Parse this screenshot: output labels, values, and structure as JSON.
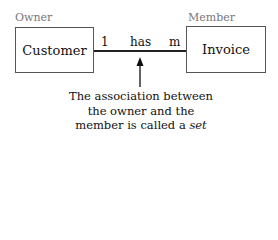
{
  "owner": {
    "role_label": "Owner",
    "entity": "Customer",
    "cardinality": "1"
  },
  "member": {
    "role_label": "Member",
    "entity": "Invoice",
    "cardinality": "m"
  },
  "relationship": {
    "label": "has"
  },
  "caption": {
    "line1": "The association between",
    "line2": "the owner and the",
    "line3_prefix": "member is called a ",
    "line3_emphasis": "set"
  }
}
